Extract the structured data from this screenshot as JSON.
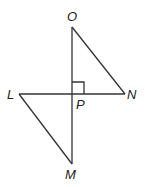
{
  "diagram": {
    "type": "geometry",
    "stroke_color": "#333333",
    "points": {
      "O": {
        "label": "O",
        "x": 72,
        "y": 27
      },
      "L": {
        "label": "L",
        "x": 19,
        "y": 94
      },
      "P": {
        "label": "P",
        "x": 72,
        "y": 94
      },
      "N": {
        "label": "N",
        "x": 125,
        "y": 94
      },
      "M": {
        "label": "M",
        "x": 72,
        "y": 164
      }
    },
    "segments": [
      "OM",
      "LN",
      "ON",
      "LM"
    ],
    "right_angle_at": "P",
    "labels": {
      "O": "O",
      "L": "L",
      "P": "P",
      "N": "N",
      "M": "M"
    }
  }
}
